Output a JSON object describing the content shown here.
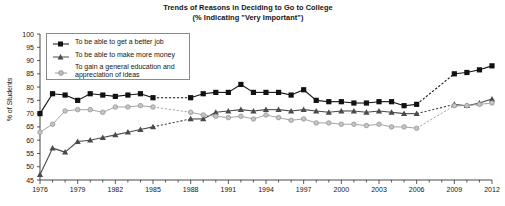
{
  "chart_data": {
    "type": "line",
    "title": "Trends of Reasons in Deciding to Go to College",
    "subtitle": "(% Indicating \"Very Important\")",
    "xlabel": "",
    "ylabel": "% of Students",
    "ylim": [
      45,
      100
    ],
    "xlim": [
      1976,
      2012
    ],
    "ytick_labels": [
      "100",
      "95",
      "90",
      "85",
      "80",
      "75",
      "70",
      "65",
      "60",
      "55",
      "50",
      "45"
    ],
    "ytick_values": [
      100,
      95,
      90,
      85,
      80,
      75,
      70,
      65,
      60,
      55,
      50,
      45
    ],
    "xtick_labels": [
      "1976",
      "1979",
      "1982",
      "1985",
      "1988",
      "1991",
      "1994",
      "1997",
      "2000",
      "2003",
      "2006",
      "2009",
      "2012"
    ],
    "xtick_values": [
      1976,
      1979,
      1982,
      1985,
      1988,
      1991,
      1994,
      1997,
      2000,
      2003,
      2006,
      2009,
      2012
    ],
    "grid": false,
    "legend_position": "upper-left",
    "series": [
      {
        "name": "To be able to get a better job",
        "marker": "square",
        "color": "#111111",
        "x": [
          1976,
          1977,
          1978,
          1979,
          1980,
          1981,
          1982,
          1983,
          1984,
          1985,
          1988,
          1989,
          1990,
          1991,
          1992,
          1993,
          1994,
          1995,
          1996,
          1997,
          1998,
          1999,
          2000,
          2001,
          2002,
          2003,
          2004,
          2005,
          2006,
          2009,
          2010,
          2011,
          2012
        ],
        "values": [
          70.0,
          77.5,
          77.0,
          75.0,
          77.5,
          77.0,
          76.5,
          77.0,
          77.5,
          76.0,
          76.0,
          77.5,
          78.0,
          78.0,
          81.0,
          78.0,
          78.0,
          78.0,
          77.0,
          79.0,
          75.0,
          74.5,
          74.5,
          74.0,
          74.0,
          74.5,
          74.5,
          73.0,
          73.5,
          85.0,
          85.5,
          86.5,
          88.0
        ],
        "gaps": [
          [
            1985,
            1988
          ],
          [
            2006,
            2009
          ]
        ]
      },
      {
        "name": "To be able to make more money",
        "marker": "triangle",
        "color": "#4a4a4a",
        "x": [
          1976,
          1977,
          1978,
          1979,
          1980,
          1981,
          1982,
          1983,
          1984,
          1985,
          1988,
          1989,
          1990,
          1991,
          1992,
          1993,
          1994,
          1995,
          1996,
          1997,
          1998,
          1999,
          2000,
          2001,
          2002,
          2003,
          2004,
          2005,
          2006,
          2009,
          2010,
          2011,
          2012
        ],
        "values": [
          47.0,
          57.0,
          55.5,
          59.5,
          60.0,
          61.0,
          62.0,
          63.0,
          64.0,
          65.0,
          68.0,
          68.0,
          70.5,
          71.0,
          71.5,
          71.0,
          71.5,
          71.5,
          71.0,
          71.5,
          71.0,
          70.5,
          71.0,
          71.0,
          70.5,
          71.0,
          70.5,
          70.0,
          70.0,
          73.5,
          73.0,
          74.0,
          75.5
        ]
      },
      {
        "name": "To gain a general education and appreciation of ideas",
        "marker": "circle",
        "color": "#9a9a9a",
        "x": [
          1976,
          1977,
          1978,
          1979,
          1980,
          1981,
          1982,
          1983,
          1984,
          1985,
          1988,
          1989,
          1990,
          1991,
          1992,
          1993,
          1994,
          1995,
          1996,
          1997,
          1998,
          1999,
          2000,
          2001,
          2002,
          2003,
          2004,
          2005,
          2006,
          2009,
          2010,
          2011,
          2012
        ],
        "values": [
          63.0,
          66.0,
          71.0,
          71.5,
          71.5,
          70.5,
          72.5,
          72.5,
          73.0,
          72.5,
          70.5,
          69.5,
          69.0,
          68.5,
          69.0,
          68.0,
          69.5,
          68.5,
          67.5,
          68.0,
          66.5,
          66.5,
          66.0,
          66.0,
          65.5,
          66.0,
          65.0,
          65.0,
          64.5,
          73.0,
          73.0,
          73.5,
          74.0
        ]
      }
    ]
  },
  "legend": {
    "items": [
      {
        "label": "To be able to get a better job"
      },
      {
        "label": "To be able to make more money"
      },
      {
        "label": "To gain a general education and appreciation of ideas"
      }
    ]
  }
}
